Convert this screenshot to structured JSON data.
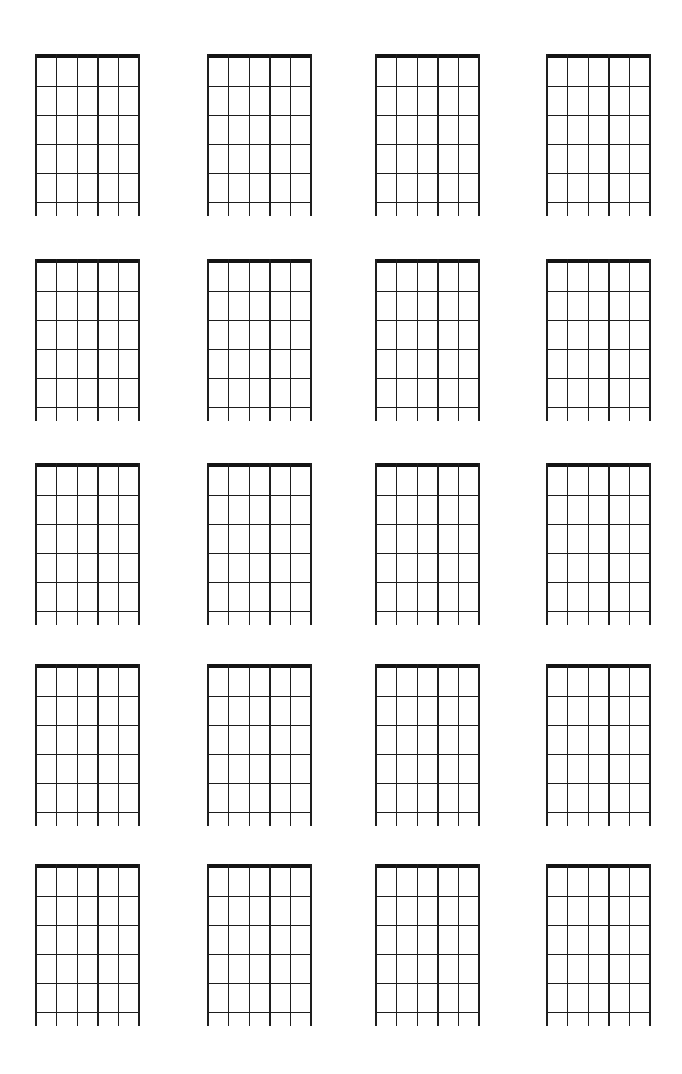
{
  "page": {
    "type": "blank-chord-diagram-sheet",
    "background_color": "#ffffff",
    "line_color": "#1e1e1e",
    "nut_color": "#141414"
  },
  "sheet": {
    "rows": 5,
    "columns": 4,
    "diagram_count": 20
  },
  "diagram": {
    "instrument": "guitar",
    "strings": 6,
    "frets_shown": 5,
    "has_nut": true,
    "string_tails_below_last_fret": true,
    "markings": []
  }
}
